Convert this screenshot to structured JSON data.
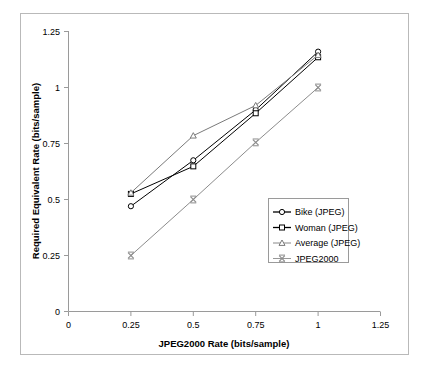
{
  "chart_data": {
    "type": "line",
    "title": "",
    "xlabel": "JPEG2000 Rate (bits/sample)",
    "ylabel": "Required Equivalent Rate (bits/sample)",
    "xlim": [
      0,
      1.25
    ],
    "ylim": [
      0,
      1.25
    ],
    "xticks": [
      "0",
      "0.25",
      "0.5",
      "0.75",
      "1",
      "1.25"
    ],
    "yticks": [
      "0",
      "0.25",
      "0.5",
      "0.75",
      "1",
      "1.25"
    ],
    "xtick_values": [
      0,
      0.25,
      0.5,
      0.75,
      1,
      1.25
    ],
    "ytick_values": [
      0,
      0.25,
      0.5,
      0.75,
      1,
      1.25
    ],
    "grid": false,
    "legend_position": "center-right",
    "x": [
      0.25,
      0.5,
      0.75,
      1
    ],
    "series": [
      {
        "name": "Bike (JPEG)",
        "marker": "circle",
        "color": "#000000",
        "values": [
          0.47,
          0.675,
          0.9,
          1.16
        ]
      },
      {
        "name": "Woman (JPEG)",
        "marker": "square",
        "color": "#000000",
        "values": [
          0.525,
          0.648,
          0.885,
          1.135
        ]
      },
      {
        "name": "Average (JPEG)",
        "marker": "triangle",
        "color": "#7a7a7a",
        "values": [
          0.53,
          0.785,
          0.92,
          1.145
        ]
      },
      {
        "name": "JPEG2000",
        "marker": "x",
        "color": "#8c8c8c",
        "values": [
          0.25,
          0.5,
          0.755,
          1.0
        ]
      }
    ]
  },
  "legend": {
    "items": [
      {
        "label": "Bike (JPEG)"
      },
      {
        "label": "Woman (JPEG)"
      },
      {
        "label": "Average (JPEG)"
      },
      {
        "label": "JPEG2000"
      }
    ]
  },
  "axes": {
    "x_title": "JPEG2000 Rate (bits/sample)",
    "y_title": "Required Equivalent Rate (bits/sample)",
    "x_tick_labels": [
      "0",
      "0.25",
      "0.5",
      "0.75",
      "1",
      "1.25"
    ],
    "y_tick_labels": [
      "0",
      "0.25",
      "0.5",
      "0.75",
      "1",
      "1.25"
    ]
  },
  "colors": {
    "axis": "#9a9a9a",
    "frame": "#b9b9b9",
    "dark_series": "#000000",
    "light_series": "#8c8c8c",
    "background": "#ffffff"
  }
}
